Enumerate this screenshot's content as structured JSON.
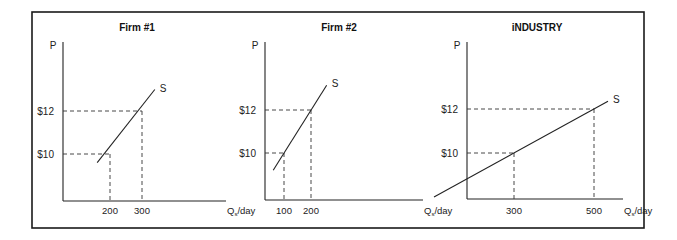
{
  "chart_data": [
    {
      "type": "line",
      "title": "Firm #1",
      "ylabel": "P",
      "xlabel": "Q_s/day",
      "curve_label": "S",
      "y_ticks": [
        {
          "value": 10,
          "label": "$10"
        },
        {
          "value": 12,
          "label": "$12"
        }
      ],
      "x_ticks": [
        {
          "value": 200,
          "label": "200"
        },
        {
          "value": 300,
          "label": "300"
        }
      ],
      "points": [
        {
          "q": 200,
          "p": 10
        },
        {
          "q": 300,
          "p": 12
        }
      ],
      "curve": [
        {
          "q": 160,
          "p": 9.6
        },
        {
          "q": 340,
          "p": 13.0
        }
      ],
      "xlim": [
        0,
        620
      ],
      "ylim": [
        0,
        16.1
      ]
    },
    {
      "type": "line",
      "title": "Firm #2",
      "ylabel": "P",
      "xlabel": "Q_s/day",
      "curve_label": "S",
      "y_ticks": [
        {
          "value": 10,
          "label": "$10"
        },
        {
          "value": 12,
          "label": "$12"
        }
      ],
      "x_ticks": [
        {
          "value": 100,
          "label": "100"
        },
        {
          "value": 200,
          "label": "200"
        }
      ],
      "points": [
        {
          "q": 100,
          "p": 10
        },
        {
          "q": 200,
          "p": 12
        }
      ],
      "curve": [
        {
          "q": 60,
          "p": 9.2
        },
        {
          "q": 258,
          "p": 13.15
        }
      ],
      "xlim": [
        0,
        590
      ],
      "ylim": [
        0,
        16.3
      ]
    },
    {
      "type": "line",
      "title": "iNDUSTRY",
      "ylabel": "P",
      "xlabel": "Q_s/day",
      "curve_label": "S",
      "y_ticks": [
        {
          "value": 10,
          "label": "$10"
        },
        {
          "value": 12,
          "label": "$12"
        }
      ],
      "x_ticks": [
        {
          "value": 300,
          "label": "300"
        },
        {
          "value": 500,
          "label": "500"
        }
      ],
      "points": [
        {
          "q": 300,
          "p": 10
        },
        {
          "q": 500,
          "p": 12
        }
      ],
      "curve": [
        {
          "q": 100,
          "p": 8.0
        },
        {
          "q": 535,
          "p": 12.35
        }
      ],
      "xlim": [
        0,
        650
      ],
      "ylim": [
        0,
        16.4
      ]
    }
  ]
}
